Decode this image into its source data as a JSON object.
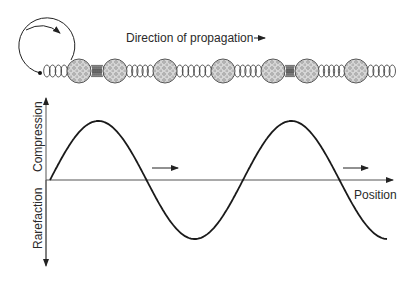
{
  "diagram": {
    "title_label": "Direction of propagation",
    "x_axis_label": "Position",
    "y_axis_positive_label": "Compression",
    "y_axis_negative_label": "Rarefaction",
    "colors": {
      "line": "#1a1a1a",
      "axis": "#555555",
      "bead_fill": "#d6d6d6",
      "bead_texture": "#7a7a7a",
      "spring": "#333333"
    },
    "beads": [
      {
        "cx": 79
      },
      {
        "cx": 115
      },
      {
        "cx": 165
      },
      {
        "cx": 223
      },
      {
        "cx": 273
      },
      {
        "cx": 307
      },
      {
        "cx": 356
      }
    ],
    "springs": [
      {
        "x1": 44,
        "x2": 67,
        "state": "relaxed"
      },
      {
        "x1": 91,
        "x2": 103,
        "state": "compressed"
      },
      {
        "x1": 127,
        "x2": 153,
        "state": "relaxed"
      },
      {
        "x1": 177,
        "x2": 211,
        "state": "relaxed"
      },
      {
        "x1": 235,
        "x2": 261,
        "state": "relaxed"
      },
      {
        "x1": 285,
        "x2": 295,
        "state": "compressed"
      },
      {
        "x1": 319,
        "x2": 344,
        "state": "relaxed"
      },
      {
        "x1": 368,
        "x2": 395,
        "state": "relaxed"
      }
    ],
    "wave": {
      "type": "sine",
      "start_x": 50,
      "baseline_y": 180,
      "amplitude_px": 59,
      "wavelength_px": 193,
      "end_x": 387
    },
    "motion_arrows": [
      {
        "x1": 152,
        "x2": 178,
        "y": 168
      },
      {
        "x1": 343,
        "x2": 368,
        "y": 168
      }
    ]
  }
}
